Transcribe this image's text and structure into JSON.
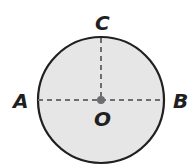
{
  "diagram": {
    "type": "circle",
    "center": {
      "label": "O",
      "x": 101,
      "y": 100
    },
    "radius": 63,
    "fill": "#e6e6e6",
    "stroke": "#231f20",
    "dash_color": "#6d6e71",
    "points": [
      {
        "label": "A",
        "position": "left"
      },
      {
        "label": "B",
        "position": "right"
      },
      {
        "label": "C",
        "position": "top"
      }
    ],
    "segments": [
      {
        "from": "A",
        "to": "B",
        "style": "dashed"
      },
      {
        "from": "O",
        "to": "C",
        "style": "dashed"
      }
    ]
  }
}
